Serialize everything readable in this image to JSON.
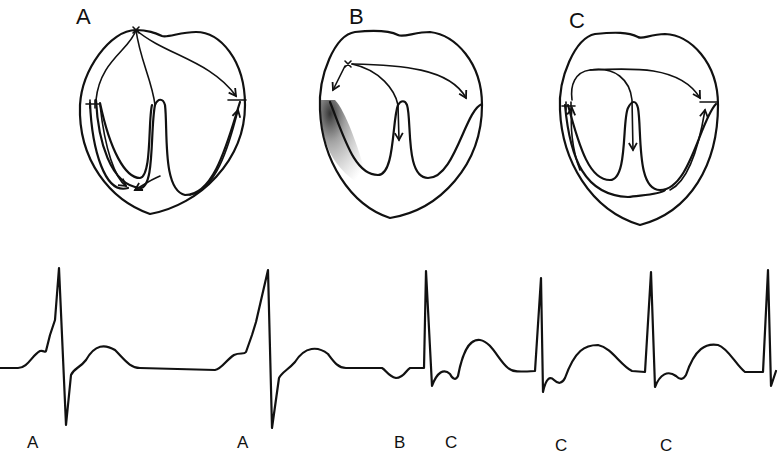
{
  "figure": {
    "panels": [
      {
        "id": "A",
        "label": "A",
        "description": "Normal conduction: impulse from sinus node (x) travels down both bundle branches and across atria"
      },
      {
        "id": "B",
        "label": "B",
        "description": "Ectopic origin near left side with stippled (shaded) region on left ventricular wall"
      },
      {
        "id": "C",
        "label": "C",
        "description": "Re-entrant pathway looping through atrium and bundle branches"
      }
    ],
    "ecg": {
      "beat_labels": [
        "A",
        "A",
        "B",
        "C",
        "C",
        "C"
      ],
      "line_color": "#111111",
      "background": "#ffffff"
    }
  }
}
